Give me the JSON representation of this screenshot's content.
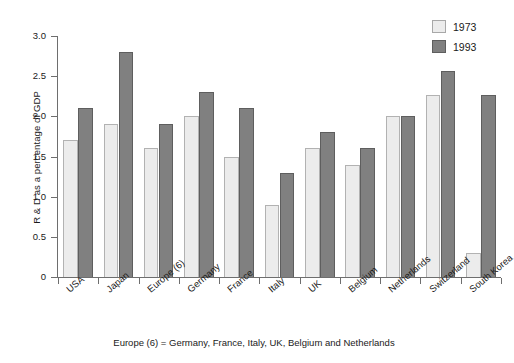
{
  "chart_data": {
    "type": "bar",
    "title": "",
    "xlabel": "",
    "ylabel": "R & D as a percentage of GDP",
    "ylim": [
      0,
      3.0
    ],
    "yticks": [
      "0",
      "0.5",
      "1.0",
      "1.5",
      "2.0",
      "2.5",
      "3.0"
    ],
    "ytick_values": [
      0,
      0.5,
      1.0,
      1.5,
      2.0,
      2.5,
      3.0
    ],
    "grid": false,
    "legend_position": "top-right",
    "categories": [
      "USA",
      "Japan",
      "Europe (6)",
      "Germany",
      "France",
      "Italy",
      "UK",
      "Belgium",
      "Netherlands",
      "Switzerland",
      "South Korea"
    ],
    "series": [
      {
        "name": "1973",
        "color": "#ececec",
        "values": [
          1.7,
          1.9,
          1.6,
          2.0,
          1.5,
          0.9,
          1.6,
          1.4,
          2.0,
          2.27,
          0.3
        ]
      },
      {
        "name": "1993",
        "color": "#808080",
        "values": [
          2.1,
          2.8,
          1.9,
          2.3,
          2.1,
          1.3,
          1.8,
          1.6,
          2.0,
          2.57,
          2.27
        ]
      }
    ],
    "annotations": [
      "Europe (6) = Germany, France, Italy, UK, Belgium and Netherlands"
    ]
  },
  "legend": {
    "items": [
      {
        "label": "1973"
      },
      {
        "label": "1993"
      }
    ]
  },
  "footnote": "Europe (6) = Germany, France, Italy, UK, Belgium and Netherlands"
}
